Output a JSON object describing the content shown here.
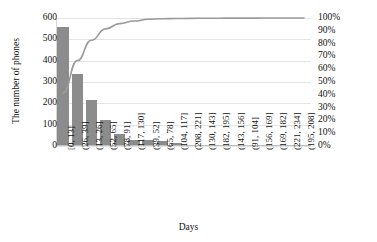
{
  "chart_data": {
    "type": "bar",
    "title": "",
    "xlabel": "Days",
    "ylabel": "The number of phones",
    "y2label": "",
    "grid": true,
    "legend": "none",
    "ylim": [
      0,
      600
    ],
    "yticks": [
      "0",
      "100",
      "200",
      "300",
      "400",
      "500",
      "600"
    ],
    "y2lim": [
      0,
      100
    ],
    "y2ticks": [
      "0%",
      "10%",
      "20%",
      "30%",
      "40%",
      "50%",
      "60%",
      "70%",
      "80%",
      "90%",
      "100%"
    ],
    "categories": [
      "[0, 13]",
      "(26, 39]",
      "(13, 26]",
      "(52, 65]",
      "(78, 91]",
      "(117, 130]",
      "(39, 52]",
      "(65, 78]",
      "(104, 117]",
      "(208, 221]",
      "(130, 143]",
      "(182, 195]",
      "(143, 156]",
      "(91, 104]",
      "(156, 169]",
      "(169, 182]",
      "(221, 234]",
      "(195, 208]"
    ],
    "series": [
      {
        "name": "The number of phones",
        "type": "bar",
        "color": "#8c8c8c",
        "values": [
          557,
          337,
          215,
          120,
          55,
          27,
          27,
          23,
          12,
          4,
          3,
          3,
          3,
          2,
          1,
          1,
          1,
          1
        ]
      },
      {
        "name": "Cumulative percentage",
        "type": "line",
        "color": "#9a9a9a",
        "values": [
          41.5,
          66.6,
          82.6,
          91.5,
          95.6,
          97.6,
          99.0,
          99.4,
          99.6,
          99.7,
          99.8,
          99.85,
          99.9,
          99.92,
          99.95,
          99.97,
          99.99,
          100.0
        ]
      }
    ]
  }
}
